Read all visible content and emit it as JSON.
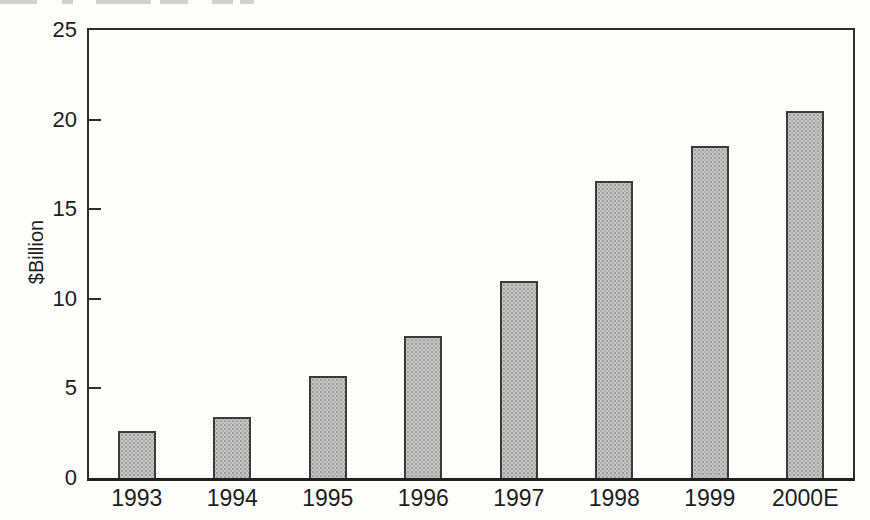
{
  "chart_data": {
    "type": "bar",
    "title": "",
    "xlabel": "",
    "ylabel": "$Billion",
    "categories": [
      "1993",
      "1994",
      "1995",
      "1996",
      "1997",
      "1998",
      "1999",
      "2000E"
    ],
    "values": [
      2.6,
      3.4,
      5.7,
      7.9,
      11.0,
      16.6,
      18.5,
      20.5
    ],
    "ylim": [
      0,
      25
    ],
    "yticks": [
      0,
      5,
      10,
      15,
      20,
      25
    ],
    "grid": "off",
    "legend": "none",
    "bar_fill_color": "#c8c8c8",
    "bar_halftone_dot_color": "#9d9d9d",
    "bar_border_color": "#3b3b3b",
    "axis_color": "#2e2e2e",
    "text_color": "#1d1d1d",
    "background_color": "#fdfdfc"
  }
}
